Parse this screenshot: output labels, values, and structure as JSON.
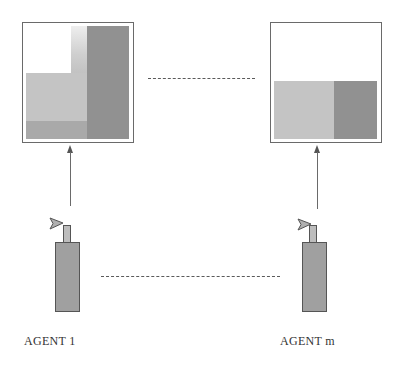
{
  "diagram": {
    "type": "multi-agent-environment",
    "agents": [
      {
        "label": "AGENT 1",
        "environment_regions": [
          "white",
          "light",
          "fade",
          "dark-right-column",
          "mid-bottom-band"
        ]
      },
      {
        "label": "AGENT m",
        "environment_regions": [
          "white-top",
          "light-bottom-left",
          "dark-bottom-right"
        ]
      }
    ],
    "connectors": {
      "top_ellipsis": "dashed",
      "bottom_ellipsis": "dashed",
      "arrow_direction": "agent-to-environment (upward)"
    },
    "colors": {
      "border": "#6a6a6a",
      "light_gray": "#d6d6d6",
      "mid_gray": "#bcbcbc",
      "dark_gray": "#a4a4a4",
      "text": "#333333"
    },
    "icons": {
      "agent": "spray-bottle-icon",
      "arrow": "arrow-up-icon"
    }
  }
}
